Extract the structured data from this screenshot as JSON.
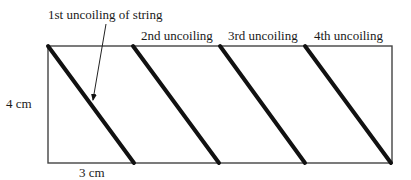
{
  "diagram": {
    "labels": {
      "first_uncoiling": "1st uncoiling of string",
      "second_uncoiling": "2nd uncoiling",
      "third_uncoiling": "3rd uncoiling",
      "fourth_uncoiling": "4th uncoiling",
      "height": "4 cm",
      "width": "3 cm"
    },
    "colors": {
      "outline": "#444444",
      "string": "#111111"
    }
  }
}
